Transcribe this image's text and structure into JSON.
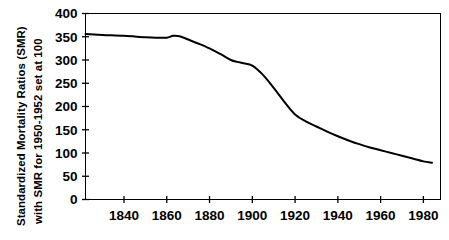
{
  "figure": {
    "background_color": "#ffffff",
    "ink_color": "#000000",
    "cropped_title_hint": ""
  },
  "axes": {
    "y_axis_caption_line_1": "Standardized Mortality Ratios (SMR)",
    "y_axis_caption_line_2": "with SMR for 1950-1952 set at 100",
    "x_axis_caption": ""
  },
  "chart_data": {
    "type": "line",
    "title": "",
    "subtitle": "",
    "xlabel": "",
    "ylabel": "Standardized Mortality Ratios (SMR) with SMR for 1950-1952 set at 100",
    "xlim": [
      1822,
      1988
    ],
    "ylim": [
      0,
      400
    ],
    "xticks": [
      1840,
      1860,
      1880,
      1900,
      1920,
      1940,
      1960,
      1980
    ],
    "xticklabels": [
      "1840",
      "1860",
      "1880",
      "1900",
      "1920",
      "1940",
      "1960",
      "1980"
    ],
    "yticks": [
      0,
      50,
      100,
      150,
      200,
      250,
      300,
      350,
      400
    ],
    "yticklabels": [
      "0",
      "50",
      "100",
      "150",
      "200",
      "250",
      "300",
      "350",
      "400"
    ],
    "grid": false,
    "legend": null,
    "legend_position": "none",
    "frame": "box",
    "series": [
      {
        "name": "Standardized Mortality Ratio",
        "color": "#000000",
        "line_width": 2,
        "x": [
          1822,
          1830,
          1840,
          1850,
          1855,
          1860,
          1863,
          1866,
          1870,
          1875,
          1880,
          1885,
          1890,
          1893,
          1896,
          1900,
          1905,
          1910,
          1915,
          1920,
          1925,
          1930,
          1935,
          1940,
          1945,
          1950,
          1955,
          1960,
          1965,
          1970,
          1975,
          1980,
          1984
        ],
        "y": [
          356,
          354,
          352,
          349,
          348,
          348,
          352,
          351,
          344,
          335,
          325,
          313,
          300,
          296,
          293,
          288,
          268,
          240,
          210,
          183,
          168,
          157,
          146,
          136,
          127,
          119,
          112,
          106,
          100,
          94,
          88,
          82,
          79
        ]
      }
    ]
  }
}
